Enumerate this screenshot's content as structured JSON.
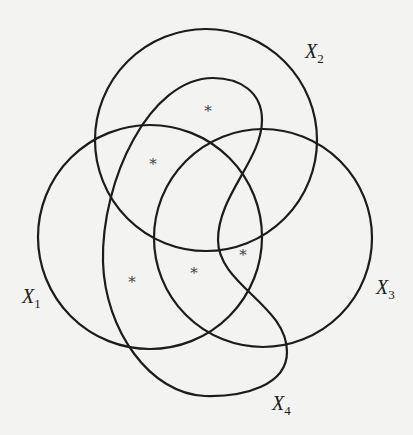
{
  "diagram": {
    "type": "venn-like",
    "sets": [
      {
        "id": "X1",
        "label": "X",
        "subscript": "1",
        "shape": "circle",
        "cx": 150,
        "cy": 237,
        "r": 112,
        "label_pos": [
          22,
          285
        ]
      },
      {
        "id": "X2",
        "label": "X",
        "subscript": "2",
        "shape": "circle",
        "cx": 206,
        "cy": 140,
        "r": 111,
        "label_pos": [
          305,
          40
        ]
      },
      {
        "id": "X3",
        "label": "X",
        "subscript": "3",
        "shape": "circle",
        "cx": 263,
        "cy": 238,
        "r": 109,
        "label_pos": [
          376,
          276
        ]
      },
      {
        "id": "X4",
        "label": "X",
        "subscript": "4",
        "shape": "closed-curve",
        "label_pos": [
          272,
          392
        ]
      }
    ],
    "markers": [
      {
        "symbol": "*",
        "x": 208,
        "y": 116
      },
      {
        "symbol": "*",
        "x": 153,
        "y": 169
      },
      {
        "symbol": "*",
        "x": 243,
        "y": 260
      },
      {
        "symbol": "*",
        "x": 194,
        "y": 278
      },
      {
        "symbol": "*",
        "x": 132,
        "y": 287
      }
    ],
    "stroke_color": "#1c1c1c",
    "background": "#f3f3f1"
  }
}
